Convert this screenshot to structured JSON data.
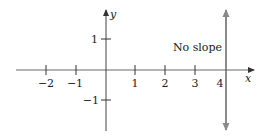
{
  "figure": {
    "x_axis": {
      "label": "x",
      "ticks": [
        {
          "value": -2,
          "label": "−2"
        },
        {
          "value": -1,
          "label": "−1"
        },
        {
          "value": 1,
          "label": "1"
        },
        {
          "value": 2,
          "label": "2"
        },
        {
          "value": 3,
          "label": "3"
        },
        {
          "value": 4,
          "label": "4"
        }
      ]
    },
    "y_axis": {
      "label": "y",
      "ticks": [
        {
          "value": 1,
          "label": "1"
        },
        {
          "value": -1,
          "label": "−1"
        }
      ]
    },
    "line": {
      "equation": "x = 4",
      "annotation": "No slope",
      "color": "#8a8a8a"
    },
    "axis_color": "#555555"
  }
}
